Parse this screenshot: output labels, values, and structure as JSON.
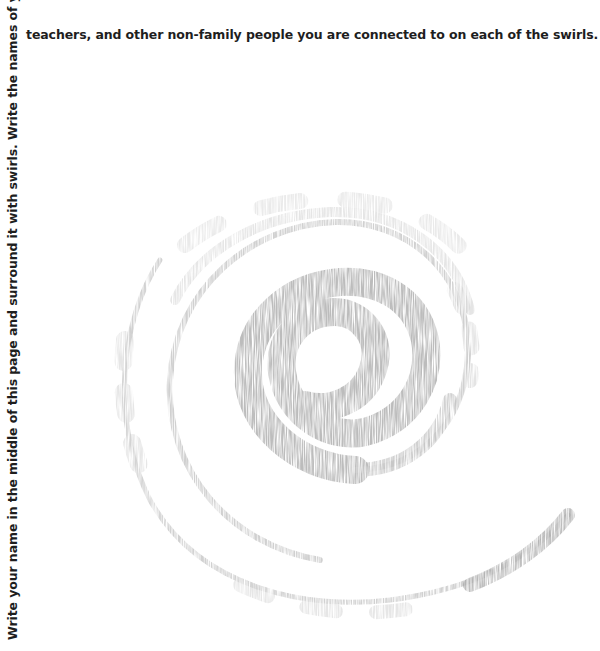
{
  "instructions": {
    "vertical_text": "Write your name in the middle of this page and surround it with swirls. Write the names of your friends,",
    "horizontal_text": "teachers, and other non-family people you are connected to on each of the swirls."
  },
  "swirl": {
    "icon": "spiral-swirl-graphic",
    "color": "#b4b4b4",
    "center": [
      340,
      355
    ],
    "turns": 2.6
  }
}
